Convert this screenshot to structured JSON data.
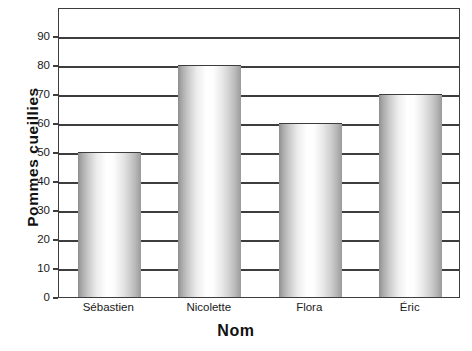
{
  "chart_data": {
    "type": "bar",
    "title": "",
    "xlabel": "Nom",
    "ylabel": "Pommes cueillies",
    "categories": [
      "Sébastien",
      "Nicolette",
      "Flora",
      "Éric"
    ],
    "values": [
      50,
      80,
      60,
      70
    ],
    "series": [
      {
        "name": "Pommes cueillies",
        "values": [
          50,
          80,
          60,
          70
        ]
      }
    ],
    "ylim": [
      0,
      100
    ],
    "ytick_labels": [
      "0",
      "10",
      "20",
      "30",
      "40",
      "50",
      "60",
      "70",
      "80",
      "90"
    ],
    "ytick_values": [
      0,
      10,
      20,
      30,
      40,
      50,
      60,
      70,
      80,
      90
    ],
    "ytick_step": 10,
    "grid": "horizontal",
    "legend": "none",
    "bar_fill": "grayscale-cylindrical-gradient",
    "frame_color": "#3d3d3d",
    "background": "#ffffff"
  }
}
